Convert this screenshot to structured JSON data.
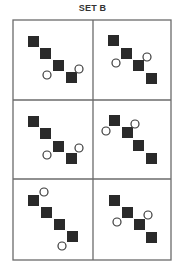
{
  "title": "SET B",
  "colors": {
    "line": "#6b6b6b",
    "square": "#2a2a2a",
    "circle_stroke": "#3a3a3a",
    "circle_fill": "#ffffff"
  },
  "grid": {
    "left": 13,
    "top": 20,
    "right": 171,
    "bottom": 260,
    "col_divider": 93,
    "row_dividers": [
      100,
      179
    ]
  },
  "cells": [
    {
      "squares": [
        [
          28,
          36
        ],
        [
          40,
          48
        ],
        [
          53,
          60
        ],
        [
          66,
          72
        ]
      ],
      "circles": [
        [
          47,
          75
        ],
        [
          79,
          69
        ]
      ]
    },
    {
      "squares": [
        [
          108,
          35
        ],
        [
          121,
          48
        ],
        [
          133,
          60
        ],
        [
          146,
          73
        ]
      ],
      "circles": [
        [
          116,
          63
        ],
        [
          147,
          57
        ]
      ]
    },
    {
      "squares": [
        [
          28,
          116
        ],
        [
          40,
          128
        ],
        [
          53,
          141
        ],
        [
          66,
          153
        ]
      ],
      "circles": [
        [
          47,
          155
        ],
        [
          79,
          148
        ]
      ]
    },
    {
      "squares": [
        [
          109,
          115
        ],
        [
          122,
          127
        ],
        [
          133,
          140
        ],
        [
          146,
          153
        ]
      ],
      "circles": [
        [
          106,
          131
        ],
        [
          135,
          124
        ]
      ]
    },
    {
      "squares": [
        [
          28,
          195
        ],
        [
          41,
          207
        ],
        [
          54,
          219
        ],
        [
          67,
          231
        ]
      ],
      "circles": [
        [
          44,
          192
        ],
        [
          62,
          246
        ]
      ]
    },
    {
      "squares": [
        [
          109,
          195
        ],
        [
          122,
          207
        ],
        [
          134,
          219
        ],
        [
          146,
          232
        ]
      ],
      "circles": [
        [
          117,
          222
        ],
        [
          148,
          215
        ]
      ]
    }
  ],
  "square_size": 11,
  "circle_radius": 4
}
